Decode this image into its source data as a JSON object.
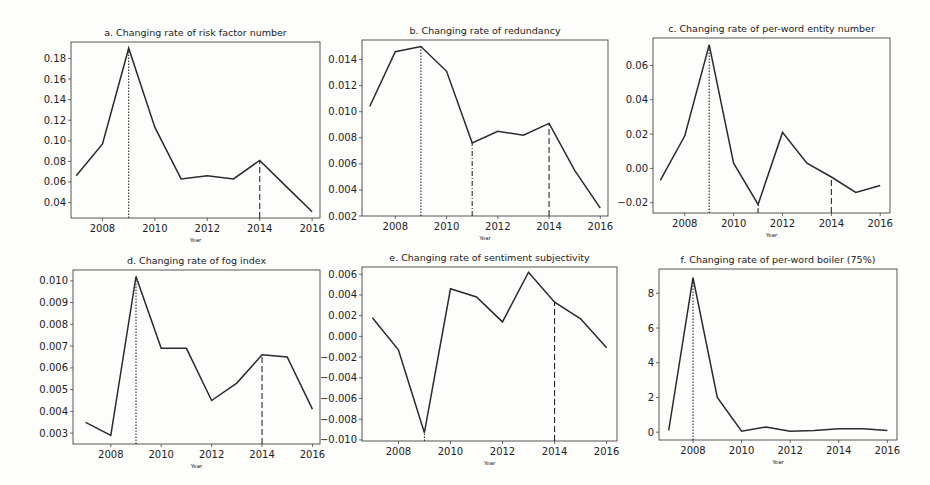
{
  "figure": {
    "xlabel": "Year",
    "line_color": "#2a2a2a",
    "axis_color": "#444444"
  },
  "chart_data": [
    {
      "id": "a",
      "type": "line",
      "title": "a. Changing rate of risk factor number",
      "xlabel": "Year",
      "ylabel": "",
      "x": [
        2007,
        2008,
        2009,
        2010,
        2011,
        2012,
        2013,
        2014,
        2015,
        2016
      ],
      "values": [
        0.066,
        0.097,
        0.19,
        0.113,
        0.063,
        0.066,
        0.063,
        0.081,
        0.056,
        0.031
      ],
      "xlim": [
        2006.8,
        2016.3
      ],
      "ylim": [
        0.025,
        0.196
      ],
      "xticks": [
        2008,
        2010,
        2012,
        2014,
        2016
      ],
      "yticks": [
        0.04,
        0.06,
        0.08,
        0.1,
        0.12,
        0.14,
        0.16,
        0.18
      ],
      "ytick_labels": [
        "0.04",
        "0.06",
        "0.08",
        "0.10",
        "0.12",
        "0.14",
        "0.16",
        "0.18"
      ],
      "vlines": [
        {
          "x": 2009,
          "style": "dotted"
        },
        {
          "x": 2014,
          "style": "dashed"
        }
      ],
      "grid": false,
      "box": {
        "left": 71,
        "top": 42,
        "width": 249,
        "height": 176
      }
    },
    {
      "id": "b",
      "type": "line",
      "title": "b. Changing rate of redundancy",
      "xlabel": "Year",
      "ylabel": "",
      "x": [
        2007,
        2008,
        2009,
        2010,
        2011,
        2012,
        2013,
        2014,
        2015,
        2016
      ],
      "values": [
        0.0104,
        0.0146,
        0.015,
        0.0131,
        0.0076,
        0.0085,
        0.0082,
        0.0091,
        0.0055,
        0.0026
      ],
      "xlim": [
        2006.7,
        2016.3
      ],
      "ylim": [
        0.002,
        0.0155
      ],
      "xticks": [
        2008,
        2010,
        2012,
        2014,
        2016
      ],
      "yticks": [
        0.002,
        0.004,
        0.006,
        0.008,
        0.01,
        0.012,
        0.014
      ],
      "ytick_labels": [
        "0.002",
        "0.004",
        "0.006",
        "0.008",
        "0.010",
        "0.012",
        "0.014"
      ],
      "vlines": [
        {
          "x": 2009,
          "style": "dotted"
        },
        {
          "x": 2011,
          "style": "dashdot"
        },
        {
          "x": 2014,
          "style": "dashed"
        }
      ],
      "grid": false,
      "box": {
        "left": 362,
        "top": 40,
        "width": 246,
        "height": 176
      }
    },
    {
      "id": "c",
      "type": "line",
      "title": "c. Changing rate of per-word entity number",
      "xlabel": "Year",
      "ylabel": "",
      "x": [
        2007,
        2008,
        2009,
        2010,
        2011,
        2012,
        2013,
        2014,
        2015,
        2016
      ],
      "values": [
        -0.007,
        0.019,
        0.072,
        0.003,
        -0.021,
        0.021,
        0.003,
        -0.005,
        -0.014,
        -0.01
      ],
      "xlim": [
        2006.7,
        2016.4
      ],
      "ylim": [
        -0.026,
        0.076
      ],
      "xticks": [
        2008,
        2010,
        2012,
        2014,
        2016
      ],
      "yticks": [
        -0.02,
        0.0,
        0.02,
        0.04,
        0.06
      ],
      "ytick_labels": [
        "−0.02",
        "0.00",
        "0.02",
        "0.04",
        "0.06"
      ],
      "vlines": [
        {
          "x": 2009,
          "style": "dotted"
        },
        {
          "x": 2011,
          "style": "dashdot"
        },
        {
          "x": 2014,
          "style": "dashed"
        }
      ],
      "grid": false,
      "box": {
        "left": 653,
        "top": 38,
        "width": 237,
        "height": 175
      }
    },
    {
      "id": "d",
      "type": "line",
      "title": "d. Changing rate of fog index",
      "xlabel": "Year",
      "ylabel": "",
      "x": [
        2007,
        2008,
        2009,
        2010,
        2011,
        2012,
        2013,
        2014,
        2015,
        2016
      ],
      "values": [
        0.0035,
        0.0029,
        0.0102,
        0.0069,
        0.0069,
        0.0045,
        0.0053,
        0.0066,
        0.0065,
        0.0041
      ],
      "xlim": [
        2006.5,
        2016.3
      ],
      "ylim": [
        0.0025,
        0.0105
      ],
      "xticks": [
        2008,
        2010,
        2012,
        2014,
        2016
      ],
      "yticks": [
        0.003,
        0.004,
        0.005,
        0.006,
        0.007,
        0.008,
        0.009,
        0.01
      ],
      "ytick_labels": [
        "0.003",
        "0.004",
        "0.005",
        "0.006",
        "0.007",
        "0.008",
        "0.009",
        "0.010"
      ],
      "vlines": [
        {
          "x": 2009,
          "style": "dotted"
        },
        {
          "x": 2014,
          "style": "dashed"
        }
      ],
      "grid": false,
      "box": {
        "left": 73,
        "top": 270,
        "width": 247,
        "height": 174
      }
    },
    {
      "id": "e",
      "type": "line",
      "title": "e. Changing rate of sentiment subjectivity",
      "xlabel": "Year",
      "ylabel": "",
      "x": [
        2007,
        2008,
        2009,
        2010,
        2011,
        2012,
        2013,
        2014,
        2015,
        2016
      ],
      "values": [
        0.0018,
        -0.0013,
        -0.0093,
        0.0046,
        0.0038,
        0.0014,
        0.0062,
        0.0033,
        0.0017,
        -0.0011
      ],
      "xlim": [
        2006.6,
        2016.4
      ],
      "ylim": [
        -0.0101,
        0.0067
      ],
      "xticks": [
        2008,
        2010,
        2012,
        2014,
        2016
      ],
      "yticks": [
        -0.01,
        -0.008,
        -0.006,
        -0.004,
        -0.002,
        0.0,
        0.002,
        0.004,
        0.006
      ],
      "ytick_labels": [
        "−0.010",
        "−0.008",
        "−0.006",
        "−0.004",
        "−0.002",
        "0.000",
        "0.002",
        "0.004",
        "0.006"
      ],
      "vlines": [
        {
          "x": 2009,
          "style": "dotted"
        },
        {
          "x": 2014,
          "style": "dashed"
        }
      ],
      "grid": false,
      "box": {
        "left": 362,
        "top": 267,
        "width": 255,
        "height": 174
      }
    },
    {
      "id": "f",
      "type": "line",
      "title": "f. Changing rate of per-word boiler  (75%)",
      "xlabel": "Year",
      "ylabel": "",
      "x": [
        2007,
        2008,
        2009,
        2010,
        2011,
        2012,
        2013,
        2014,
        2015,
        2016
      ],
      "values": [
        0.1,
        8.9,
        2.0,
        0.05,
        0.3,
        0.05,
        0.1,
        0.2,
        0.2,
        0.1
      ],
      "xlim": [
        2006.6,
        2016.4
      ],
      "ylim": [
        -0.45,
        9.4
      ],
      "xticks": [
        2008,
        2010,
        2012,
        2014,
        2016
      ],
      "yticks": [
        0,
        2,
        4,
        6,
        8
      ],
      "ytick_labels": [
        "0",
        "2",
        "4",
        "6",
        "8"
      ],
      "vlines": [
        {
          "x": 2008,
          "style": "dotted"
        }
      ],
      "grid": false,
      "box": {
        "left": 659,
        "top": 269,
        "width": 238,
        "height": 171
      }
    }
  ]
}
